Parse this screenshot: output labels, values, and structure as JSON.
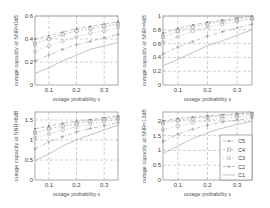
{
  "chart_data": [
    {
      "type": "line",
      "title": "",
      "xlabel": "outage probability ε",
      "ylabel": "outage capacity at SNR=0dB",
      "x": [
        0.05,
        0.1,
        0.15,
        0.2,
        0.25,
        0.3,
        0.35
      ],
      "xticks": [
        "0.1",
        "0.2",
        "0.3"
      ],
      "yticks": [
        "0",
        "0.2",
        "0.4",
        "0.6"
      ],
      "xlim": [
        0.05,
        0.35
      ],
      "ylim": [
        0,
        0.6
      ],
      "grid": true,
      "series": [
        {
          "name": "C5",
          "values": [
            0.4,
            0.43,
            0.46,
            0.49,
            0.51,
            0.53,
            0.55
          ]
        },
        {
          "name": "C4",
          "values": [
            0.36,
            0.4,
            0.44,
            0.47,
            0.49,
            0.51,
            0.53
          ]
        },
        {
          "name": "C3",
          "values": [
            0.29,
            0.34,
            0.38,
            0.42,
            0.45,
            0.47,
            0.5
          ]
        },
        {
          "name": "C2",
          "values": [
            0.21,
            0.26,
            0.31,
            0.35,
            0.38,
            0.41,
            0.44
          ]
        },
        {
          "name": "C1",
          "values": [
            0.1,
            0.15,
            0.21,
            0.26,
            0.31,
            0.34,
            0.37
          ]
        }
      ]
    },
    {
      "type": "line",
      "title": "",
      "xlabel": "outage probability ε",
      "ylabel": "outage capacity at SNR=4dB",
      "x": [
        0.05,
        0.1,
        0.15,
        0.2,
        0.25,
        0.3,
        0.35
      ],
      "xticks": [
        "0.1",
        "0.2",
        "0.3"
      ],
      "yticks": [
        "0",
        "0.2",
        "0.4",
        "0.6",
        "0.8",
        "1"
      ],
      "xlim": [
        0.05,
        0.35
      ],
      "ylim": [
        0,
        1
      ],
      "grid": true,
      "series": [
        {
          "name": "C5",
          "values": [
            0.75,
            0.82,
            0.87,
            0.91,
            0.94,
            0.97,
            1.0
          ]
        },
        {
          "name": "C4",
          "values": [
            0.7,
            0.78,
            0.84,
            0.89,
            0.92,
            0.95,
            0.97
          ]
        },
        {
          "name": "C3",
          "values": [
            0.62,
            0.7,
            0.78,
            0.84,
            0.88,
            0.92,
            0.95
          ]
        },
        {
          "name": "C2",
          "values": [
            0.45,
            0.55,
            0.63,
            0.71,
            0.77,
            0.83,
            0.88
          ]
        },
        {
          "name": "C1",
          "values": [
            0.28,
            0.37,
            0.47,
            0.57,
            0.64,
            0.72,
            0.8
          ]
        }
      ]
    },
    {
      "type": "line",
      "title": "",
      "xlabel": "outage probability ε",
      "ylabel": "outage capacity at SNR=8dB",
      "x": [
        0.05,
        0.1,
        0.15,
        0.2,
        0.25,
        0.3,
        0.35
      ],
      "xticks": [
        "0.1",
        "0.2",
        "0.3"
      ],
      "yticks": [
        "0",
        "0.5",
        "1",
        "1.5"
      ],
      "xlim": [
        0.05,
        0.35
      ],
      "ylim": [
        0,
        1.7
      ],
      "grid": true,
      "series": [
        {
          "name": "C5",
          "values": [
            1.28,
            1.35,
            1.42,
            1.47,
            1.51,
            1.56,
            1.6
          ]
        },
        {
          "name": "C4",
          "values": [
            1.18,
            1.28,
            1.35,
            1.41,
            1.47,
            1.52,
            1.56
          ]
        },
        {
          "name": "C3",
          "values": [
            1.05,
            1.15,
            1.25,
            1.33,
            1.4,
            1.46,
            1.51
          ]
        },
        {
          "name": "C2",
          "values": [
            0.78,
            0.95,
            1.08,
            1.2,
            1.29,
            1.36,
            1.43
          ]
        },
        {
          "name": "C1",
          "values": [
            0.48,
            0.65,
            0.85,
            1.0,
            1.13,
            1.25,
            1.37
          ]
        }
      ]
    },
    {
      "type": "line",
      "title": "",
      "xlabel": "outage probability ε",
      "ylabel": "outage capacity at SNR=12dB",
      "x": [
        0.05,
        0.1,
        0.15,
        0.2,
        0.25,
        0.3,
        0.35
      ],
      "xticks": [
        "0.1",
        "0.2",
        "0.3"
      ],
      "yticks": [
        "0",
        "0.5",
        "1",
        "1.5",
        "2"
      ],
      "xlim": [
        0.05,
        0.35
      ],
      "ylim": [
        0,
        2.3
      ],
      "grid": true,
      "legend": {
        "position": "lower right",
        "entries": [
          "C5",
          "C4",
          "C3",
          "C2",
          "C1"
        ]
      },
      "series": [
        {
          "name": "C5",
          "values": [
            2.0,
            2.08,
            2.13,
            2.17,
            2.21,
            2.24,
            2.27
          ]
        },
        {
          "name": "C4",
          "values": [
            1.93,
            2.02,
            2.08,
            2.13,
            2.17,
            2.21,
            2.24
          ]
        },
        {
          "name": "C3",
          "values": [
            1.7,
            1.83,
            1.93,
            2.02,
            2.08,
            2.13,
            2.18
          ]
        },
        {
          "name": "C2",
          "values": [
            1.3,
            1.55,
            1.72,
            1.85,
            1.96,
            2.03,
            2.1
          ]
        },
        {
          "name": "C1",
          "values": [
            0.9,
            1.15,
            1.4,
            1.6,
            1.75,
            1.88,
            1.98
          ]
        }
      ]
    }
  ],
  "legend": {
    "entries": [
      {
        "label": "C5",
        "marker": "dot"
      },
      {
        "label": "C4",
        "marker": "square"
      },
      {
        "label": "C3",
        "marker": "circle"
      },
      {
        "label": "C2",
        "marker": "plus"
      },
      {
        "label": "C1",
        "marker": "none"
      }
    ]
  },
  "colors": {
    "lines": "#9a9a9a",
    "grid": "#888888",
    "axes": "#555555",
    "text": "#444444"
  }
}
